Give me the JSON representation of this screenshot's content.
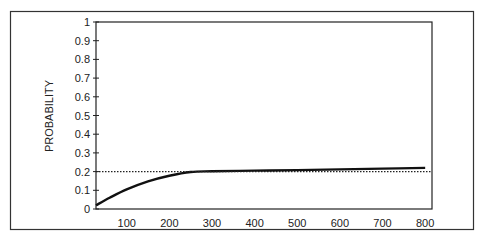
{
  "chart_data": {
    "type": "line",
    "title": "",
    "xlabel": "",
    "ylabel": "PROBABILITY",
    "x_ticks": [
      "100",
      "200",
      "300",
      "400",
      "500",
      "600",
      "700",
      "800"
    ],
    "y_ticks": [
      "0",
      "0.1",
      "0.2",
      "0.3",
      "0.4",
      "0.5",
      "0.6",
      "0.7",
      "0.8",
      "0.9",
      "1"
    ],
    "xlim": [
      28,
      816
    ],
    "ylim": [
      0,
      1
    ],
    "grid": false,
    "legend": null,
    "series": [
      {
        "name": "probability curve",
        "style": "solid",
        "x": [
          28,
          60,
          100,
          150,
          200,
          250,
          300,
          400,
          500,
          600,
          700,
          800
        ],
        "values": [
          0.02,
          0.06,
          0.105,
          0.148,
          0.178,
          0.198,
          0.202,
          0.205,
          0.208,
          0.212,
          0.216,
          0.22
        ]
      },
      {
        "name": "reference level",
        "style": "dotted",
        "x": [
          28,
          816
        ],
        "values": [
          0.2,
          0.2
        ]
      }
    ]
  }
}
